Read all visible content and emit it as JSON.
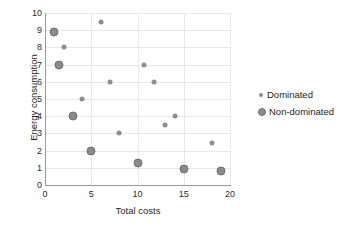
{
  "chart_data": {
    "type": "scatter",
    "title": "",
    "xlabel": "Total costs",
    "ylabel": "Energy consumption",
    "xlim": [
      0,
      20
    ],
    "ylim": [
      0,
      10
    ],
    "xticks": [
      0,
      5,
      10,
      15,
      20
    ],
    "yticks": [
      0,
      1,
      2,
      3,
      4,
      5,
      6,
      7,
      8,
      9,
      10
    ],
    "grid": true,
    "legend_position": "right",
    "marker_color": "#8c8c8c",
    "series": [
      {
        "name": "Dominated",
        "marker_size": "small",
        "points": [
          {
            "x": 2,
            "y": 8
          },
          {
            "x": 6,
            "y": 9.5
          },
          {
            "x": 4,
            "y": 5
          },
          {
            "x": 7,
            "y": 6
          },
          {
            "x": 8,
            "y": 3
          },
          {
            "x": 10.7,
            "y": 7
          },
          {
            "x": 11.8,
            "y": 6
          },
          {
            "x": 13,
            "y": 3.5
          },
          {
            "x": 14,
            "y": 4
          },
          {
            "x": 18,
            "y": 2.45
          }
        ]
      },
      {
        "name": "Non-dominated",
        "marker_size": "large",
        "points": [
          {
            "x": 1,
            "y": 8.9
          },
          {
            "x": 1.5,
            "y": 7
          },
          {
            "x": 3,
            "y": 4
          },
          {
            "x": 5,
            "y": 2
          },
          {
            "x": 10,
            "y": 1.3
          },
          {
            "x": 15,
            "y": 0.95
          },
          {
            "x": 19,
            "y": 0.8
          }
        ]
      }
    ]
  },
  "legend": {
    "items": [
      {
        "label": "Dominated"
      },
      {
        "label": "Non-dominated"
      }
    ]
  }
}
